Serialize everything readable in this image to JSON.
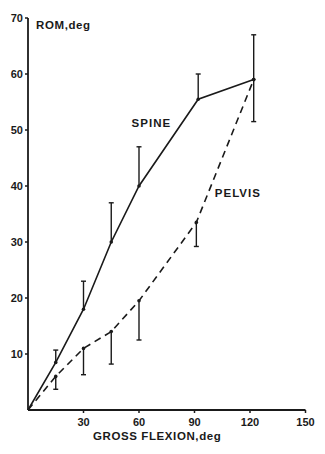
{
  "chart_data": {
    "type": "line",
    "title": "",
    "xlabel": "GROSS FLEXION, deg",
    "ylabel": "ROM, deg",
    "xlim": [
      0,
      150
    ],
    "ylim": [
      0,
      70
    ],
    "x_ticks": [
      30,
      60,
      90,
      120,
      150
    ],
    "y_ticks": [
      10,
      20,
      30,
      40,
      50,
      60,
      70
    ],
    "grid": false,
    "legend": "inline labels",
    "series": [
      {
        "name": "SPINE",
        "style": "solid",
        "x": [
          0,
          15,
          30,
          45,
          60,
          92,
          122
        ],
        "values": [
          0,
          8.5,
          18,
          30,
          40,
          55.5,
          59
        ],
        "error_bars": [
          null,
          {
            "dir": "up",
            "to": 10.7
          },
          {
            "dir": "up",
            "to": 23
          },
          {
            "dir": "up",
            "to": 37
          },
          {
            "dir": "up",
            "to": 47
          },
          {
            "dir": "up",
            "to": 60
          },
          {
            "dir": "up",
            "to": 67
          }
        ],
        "label_pos": {
          "x": 56,
          "y": 50.5
        }
      },
      {
        "name": "PELVIS",
        "style": "dashed",
        "x": [
          0,
          15,
          30,
          45,
          60,
          91,
          122
        ],
        "values": [
          0,
          6,
          11,
          14,
          19.5,
          33.5,
          59
        ],
        "error_bars": [
          null,
          {
            "dir": "down",
            "to": 3.7
          },
          {
            "dir": "down",
            "to": 6.3
          },
          {
            "dir": "down",
            "to": 8.2
          },
          {
            "dir": "down",
            "to": 12.5
          },
          {
            "dir": "down",
            "to": 29.2
          },
          {
            "dir": "down",
            "to": 51.5
          }
        ],
        "label_pos": {
          "x": 101,
          "y": 38
        }
      }
    ]
  },
  "axes": {
    "x_title": "GROSS FLEXION,deg",
    "y_title": "ROM,deg"
  },
  "colors": {
    "ink": "#1a1a1a",
    "background": "#ffffff"
  }
}
